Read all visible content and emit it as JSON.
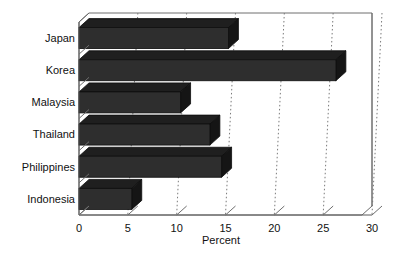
{
  "chart_data": {
    "type": "bar",
    "orientation": "horizontal",
    "title": "",
    "xlabel": "Percent",
    "ylabel": "",
    "xlim": [
      0,
      30
    ],
    "ylim": null,
    "grid": "vertical-dotted-at-xticks",
    "legend": "none",
    "xticks": [
      0,
      5,
      10,
      15,
      20,
      25,
      30
    ],
    "xticklabels": [
      "0",
      "5",
      "10",
      "15",
      "20",
      "25",
      "30"
    ],
    "categories": [
      "Japan",
      "Korea",
      "Malaysia",
      "Thailand",
      "Philippines",
      "Indonesia"
    ],
    "values": [
      15.3,
      26.3,
      10.4,
      13.4,
      14.6,
      5.4
    ],
    "bars": [
      {
        "label": "Japan",
        "value": 15.3
      },
      {
        "label": "Korea",
        "value": 26.3
      },
      {
        "label": "Malaysia",
        "value": 10.4
      },
      {
        "label": "Thailand",
        "value": 13.4
      },
      {
        "label": "Philippines",
        "value": 14.6
      },
      {
        "label": "Indonesia",
        "value": 5.4
      }
    ],
    "style": {
      "bar_face_color": "#2e2e2e",
      "bar_top_color": "#1f1f1f",
      "bar_side_color": "#151515",
      "bar_edge_color": "#0d0d0d",
      "frame_color": "#6e6e6e",
      "grid_color": "#7a7a7a",
      "text_color": "#111111",
      "background": "#ffffff",
      "three_d": true
    }
  }
}
